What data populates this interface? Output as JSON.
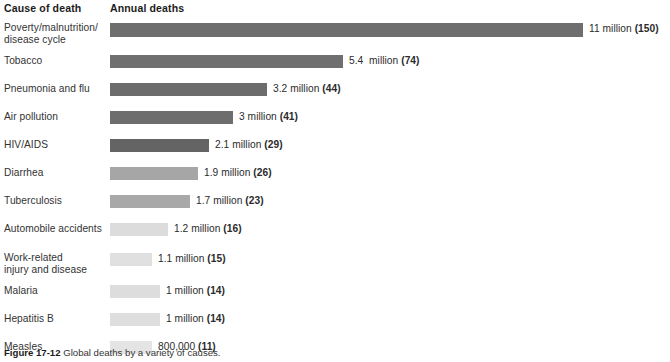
{
  "header": {
    "cause_label": "Cause of death",
    "annual_label": "Annual deaths"
  },
  "caption": {
    "figure_number": "Figure 17-12",
    "text": " Global deaths by a variety of causes."
  },
  "chart_data": {
    "type": "bar",
    "orientation": "horizontal",
    "title": "",
    "xlabel": "Annual deaths",
    "ylabel": "Cause of death",
    "grid": false,
    "legend": "none",
    "axis_visible": false,
    "value_unit": "millions of deaths per year",
    "xlim": [
      0,
      11
    ],
    "categories": [
      "Poverty/malnutrition/\ndisease cycle",
      "Tobacco",
      "Pneumonia and flu",
      "Air pollution",
      "HIV/AIDS",
      "Diarrhea",
      "Tuberculosis",
      "Automobile accidents",
      "Work-related\ninjury and disease",
      "Malaria",
      "Hepatitis B",
      "Measles"
    ],
    "values": [
      11,
      5.4,
      3.2,
      3,
      2.1,
      1.9,
      1.7,
      1.2,
      1.1,
      1,
      1,
      0.8
    ],
    "value_labels": [
      "11 million ",
      "5.4  million ",
      "3.2 million ",
      "3 million ",
      "2.1 million ",
      "1.9 million ",
      "1.7 million ",
      "1.2 million ",
      "1.1 million ",
      "1 million ",
      "1 million ",
      "800,000 "
    ],
    "secondary_values": [
      150,
      74,
      44,
      41,
      29,
      26,
      23,
      16,
      15,
      14,
      14,
      11
    ],
    "secondary_labels": [
      "(150)",
      "(74)",
      "(44)",
      "(41)",
      "(29)",
      "(26)",
      "(23)",
      "(16)",
      "(15)",
      "(14)",
      "(14)",
      "(11)"
    ],
    "bar_colors": [
      "#6e6e6e",
      "#6f6f6f",
      "#6c6c6c",
      "#6d6d6d",
      "#646464",
      "#a6a6a6",
      "#a8a8a8",
      "#dcdcdc",
      "#e0e0e0",
      "#dddddd",
      "#dedede",
      "#e4e4e4"
    ]
  },
  "layout": {
    "bar_origin_x": 110,
    "bar_max_x": 583,
    "row_tops": [
      4,
      36,
      64,
      92,
      120,
      148,
      176,
      204,
      234,
      266,
      294,
      322
    ],
    "bar_ends": [
      583,
      343,
      267,
      233,
      209,
      198,
      190,
      168,
      152,
      160,
      160,
      152
    ],
    "bar_heights": [
      14,
      13,
      13,
      13,
      13,
      13,
      13,
      13,
      13,
      13,
      13,
      13
    ]
  }
}
